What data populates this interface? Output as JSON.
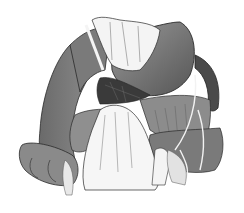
{
  "image": {
    "kind": "grayscale surgical illustration",
    "subject": "hands retracting abdominal organs (stomach, transverse colon, mesentery)",
    "width": 244,
    "height": 213,
    "text": []
  },
  "palette": {
    "background": "#ffffff",
    "organ_dark": "#5a5a5a",
    "organ_mid": "#7d7d7d",
    "organ_light": "#9a9a9a",
    "outline": "#2a2a2a",
    "hand": "#f4f4f4",
    "hand_shadow": "#cfcfcf",
    "cavity": "#3a3a3a"
  }
}
